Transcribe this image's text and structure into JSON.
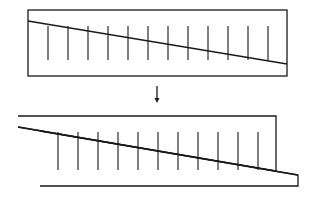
{
  "diagram": {
    "colors": {
      "line": "#1a1a1a",
      "background": "#ffffff"
    },
    "top_block": {
      "rect": {
        "x1": 28,
        "y1": 10,
        "x2": 287,
        "y2": 76
      },
      "diagonal": {
        "x1": 28,
        "y1": 21,
        "x2": 287,
        "y2": 64
      },
      "ticks": {
        "x_start": 48,
        "spacing": 20,
        "count": 12,
        "y_top": 26,
        "y_bottom": 60
      }
    },
    "arrow": {
      "x": 157,
      "y_top": 86,
      "y_bottom": 103,
      "symbol": "down-arrow"
    },
    "bottom_block": {
      "upper_wedge": {
        "points": "18,116 276,116 276,171 18,127"
      },
      "lower_wedge": {
        "points": "40,131 298,175 298,186 40,186"
      },
      "diagonal": {
        "x1": 18,
        "y1": 127,
        "x2": 298,
        "y2": 175
      },
      "ticks": {
        "x_start": 58,
        "spacing": 20,
        "count": 11,
        "y_top": 132,
        "y_bottom": 170
      }
    }
  }
}
